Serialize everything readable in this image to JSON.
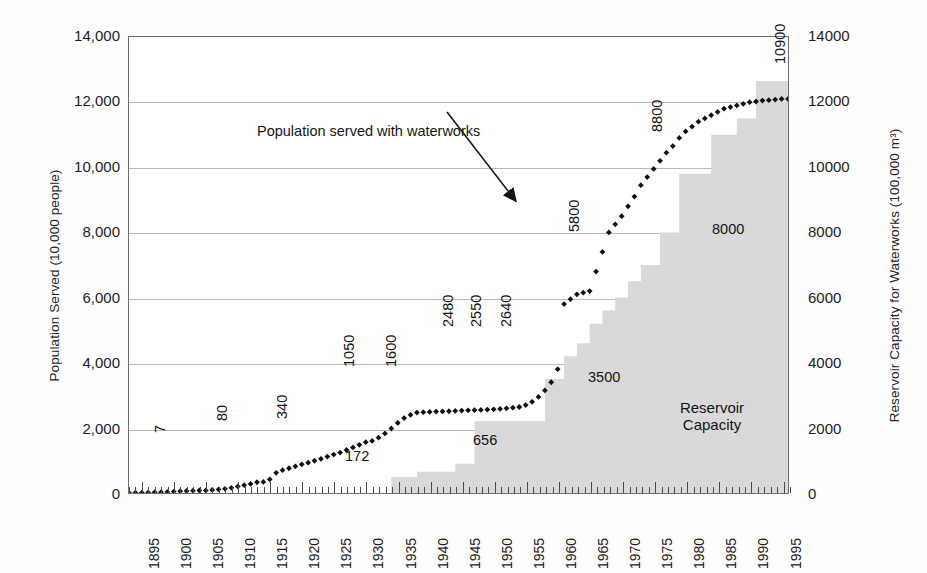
{
  "chart_data": {
    "type": "line",
    "title": "",
    "xlabel": "",
    "x": [
      1893,
      1894,
      1895,
      1896,
      1897,
      1898,
      1899,
      1900,
      1901,
      1902,
      1903,
      1904,
      1905,
      1906,
      1907,
      1908,
      1909,
      1910,
      1911,
      1912,
      1913,
      1914,
      1915,
      1916,
      1917,
      1918,
      1919,
      1920,
      1921,
      1922,
      1923,
      1924,
      1925,
      1926,
      1927,
      1928,
      1929,
      1930,
      1931,
      1932,
      1933,
      1934,
      1935,
      1936,
      1937,
      1938,
      1939,
      1940,
      1941,
      1942,
      1943,
      1944,
      1945,
      1946,
      1947,
      1948,
      1949,
      1950,
      1951,
      1952,
      1953,
      1954,
      1955,
      1956,
      1957,
      1958,
      1959,
      1960,
      1961,
      1962,
      1963,
      1964,
      1965,
      1966,
      1967,
      1968,
      1969,
      1970,
      1971,
      1972,
      1973,
      1974,
      1975,
      1976,
      1977,
      1978,
      1979,
      1980,
      1981,
      1982,
      1983,
      1984,
      1985,
      1986,
      1987,
      1988,
      1989,
      1990,
      1991,
      1992,
      1993,
      1994,
      1995,
      1996
    ],
    "grid": true,
    "legend_position": "inline-annotations",
    "axes": {
      "left": {
        "label": "Population Served (10,000 people)",
        "ticks": [
          "0",
          "2,000",
          "4,000",
          "6,000",
          "8,000",
          "10,000",
          "12,000",
          "14,000"
        ],
        "tick_values": [
          0,
          2000,
          4000,
          6000,
          8000,
          10000,
          12000,
          14000
        ],
        "ylim": [
          0,
          14000
        ]
      },
      "right": {
        "label": "Reservoir Capacity for Waterworks (100,000 m³)",
        "ticks": [
          "0",
          "2000",
          "4000",
          "6000",
          "8000",
          "10000",
          "12000",
          "14000"
        ],
        "tick_values": [
          0,
          2000,
          4000,
          6000,
          8000,
          10000,
          12000,
          14000
        ],
        "ylim": [
          0,
          14000
        ]
      },
      "x": {
        "ticks": [
          "1895",
          "1900",
          "1905",
          "1910",
          "1915",
          "1920",
          "1925",
          "1930",
          "1935",
          "1940",
          "1945",
          "1950",
          "1955",
          "1960",
          "1965",
          "1970",
          "1975",
          "1980",
          "1985",
          "1990",
          "1995"
        ],
        "tick_values": [
          1895,
          1900,
          1905,
          1910,
          1915,
          1920,
          1925,
          1930,
          1935,
          1940,
          1945,
          1950,
          1955,
          1960,
          1965,
          1970,
          1975,
          1980,
          1985,
          1990,
          1995
        ],
        "xlim": [
          1893,
          1996
        ]
      }
    },
    "series": [
      {
        "name": "Population served with waterworks",
        "axis": "left",
        "style": "markers-diamond",
        "color": "#111111",
        "values": [
          7,
          8,
          10,
          14,
          20,
          26,
          34,
          45,
          55,
          62,
          70,
          78,
          80,
          95,
          110,
          130,
          160,
          200,
          240,
          280,
          330,
          340,
          420,
          620,
          700,
          760,
          820,
          880,
          930,
          990,
          1050,
          1120,
          1180,
          1240,
          1320,
          1400,
          1480,
          1560,
          1600,
          1700,
          1830,
          1980,
          2150,
          2300,
          2400,
          2470,
          2480,
          2490,
          2500,
          2505,
          2510,
          2520,
          2530,
          2540,
          2545,
          2550,
          2560,
          2570,
          2580,
          2600,
          2620,
          2640,
          2700,
          2800,
          2950,
          3150,
          3400,
          3800,
          5800,
          5950,
          6100,
          6150,
          6200,
          6800,
          7400,
          8000,
          8250,
          8500,
          8800,
          9100,
          9450,
          9700,
          9950,
          10200,
          10450,
          10650,
          10900,
          11100,
          11250,
          11400,
          11500,
          11600,
          11700,
          11800,
          11850,
          11900,
          11950,
          12000,
          12020,
          12050,
          12060,
          12080,
          12100,
          12100
        ]
      },
      {
        "name": "Reservoir Capacity",
        "axis": "right",
        "style": "step-area",
        "color": "#d9d9d9",
        "steps": [
          {
            "from": 1934,
            "to": 1938,
            "value": 480
          },
          {
            "from": 1938,
            "to": 1944,
            "value": 656
          },
          {
            "from": 1944,
            "to": 1947,
            "value": 900
          },
          {
            "from": 1947,
            "to": 1958,
            "value": 2200
          },
          {
            "from": 1958,
            "to": 1961,
            "value": 3500
          },
          {
            "from": 1961,
            "to": 1963,
            "value": 4200
          },
          {
            "from": 1963,
            "to": 1965,
            "value": 4600
          },
          {
            "from": 1965,
            "to": 1967,
            "value": 5200
          },
          {
            "from": 1967,
            "to": 1969,
            "value": 5600
          },
          {
            "from": 1969,
            "to": 1971,
            "value": 6000
          },
          {
            "from": 1971,
            "to": 1973,
            "value": 6500
          },
          {
            "from": 1973,
            "to": 1976,
            "value": 7000
          },
          {
            "from": 1976,
            "to": 1979,
            "value": 8000
          },
          {
            "from": 1979,
            "to": 1984,
            "value": 9800
          },
          {
            "from": 1984,
            "to": 1988,
            "value": 11000
          },
          {
            "from": 1988,
            "to": 1991,
            "value": 11500
          },
          {
            "from": 1991,
            "to": 1996,
            "value": 12650
          }
        ]
      }
    ],
    "data_labels": [
      {
        "text": "7",
        "value": 7,
        "x": 1895,
        "rotated": true
      },
      {
        "text": "80",
        "value": 80,
        "x": 1905,
        "rotated": true
      },
      {
        "text": "340",
        "value": 340,
        "x": 1913,
        "rotated": true
      },
      {
        "text": "172",
        "value": 172,
        "x": 1930,
        "rotated": false
      },
      {
        "text": "1050",
        "value": 1050,
        "x": 1923,
        "rotated": true
      },
      {
        "text": "1600",
        "value": 1600,
        "x": 1931,
        "rotated": true
      },
      {
        "text": "2480",
        "value": 2480,
        "x": 1939,
        "rotated": true
      },
      {
        "text": "2550",
        "value": 2550,
        "x": 1944,
        "rotated": true
      },
      {
        "text": "2640",
        "value": 2640,
        "x": 1949,
        "rotated": true
      },
      {
        "text": "656",
        "value": 656,
        "x": 1943,
        "rotated": false
      },
      {
        "text": "3500",
        "value": 3500,
        "x": 1959,
        "rotated": false
      },
      {
        "text": "5800",
        "value": 5800,
        "x": 1962,
        "rotated": true
      },
      {
        "text": "8000",
        "value": 8000,
        "x": 1977,
        "rotated": false
      },
      {
        "text": "8800",
        "value": 8800,
        "x": 1970,
        "rotated": true
      },
      {
        "text": "10900",
        "value": 10900,
        "x": 1980,
        "rotated": true
      }
    ],
    "annotations": [
      {
        "name": "population-series-callout",
        "text": "Population served with waterworks",
        "arrow_to": [
          1966,
          8750
        ]
      },
      {
        "name": "reservoir-area-callout",
        "text_line1": "Reservoir",
        "text_line2": "Capacity"
      }
    ]
  },
  "colors": {
    "area_fill": "#d9d9d9",
    "marker": "#111111",
    "gridline": "#b9b9b9",
    "frame": "#6f6f6f",
    "text": "#1a1a1a",
    "background": "#ffffff"
  }
}
